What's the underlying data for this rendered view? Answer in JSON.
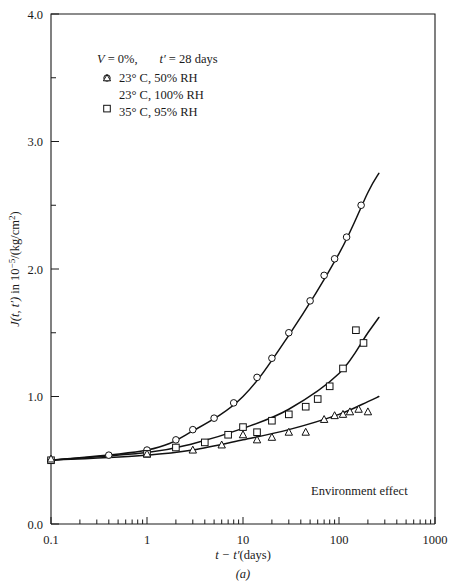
{
  "figure": {
    "caption": "(a)",
    "annotation": "Environment effect"
  },
  "legend": {
    "header_v": "V",
    "header_v_val": "= 0%,",
    "header_t": "t′",
    "header_t_val": "= 28 days",
    "entries": [
      {
        "marker": "circle",
        "label": "23° C,  50% RH"
      },
      {
        "marker": "triangle",
        "label": "23° C,  100% RH"
      },
      {
        "marker": "square",
        "label": "35° C,  95% RH"
      }
    ]
  },
  "axes": {
    "x_label_main": "t − t′",
    "x_label_unit": "(days)",
    "y_label_fn": "J(t, t′)",
    "y_label_rest": " in 10",
    "y_label_exp": "−5",
    "y_label_tail": "/(kg/cm",
    "y_label_exp2": "2",
    "y_label_close": ")",
    "x_ticks": [
      "0.1",
      "1",
      "10",
      "100",
      "1000"
    ],
    "y_ticks": [
      "0.0",
      "1.0",
      "2.0",
      "3.0",
      "4.0"
    ]
  },
  "chart_data": {
    "type": "scatter",
    "title": "",
    "subtitle": "Environment effect",
    "xlabel": "t − t′ (days)",
    "ylabel": "J(t, t′) in 10−5/(kg/cm²)",
    "xscale": "log",
    "yscale": "linear",
    "xlim": [
      0.1,
      1000
    ],
    "ylim": [
      0.0,
      4.0
    ],
    "x_tick_values": [
      0.1,
      1,
      10,
      100,
      1000
    ],
    "y_tick_values": [
      0.0,
      1.0,
      2.0,
      3.0,
      4.0
    ],
    "y_minor_tick_values": [
      0.5,
      1.5,
      2.5,
      3.5
    ],
    "grid": false,
    "legend_position": "upper-left",
    "legend_note": "V = 0%,  t′ = 28 days",
    "series": [
      {
        "name": "23° C, 50% RH",
        "marker": "circle",
        "points": [
          {
            "x": 0.1,
            "y": 0.5
          },
          {
            "x": 0.4,
            "y": 0.54
          },
          {
            "x": 1.0,
            "y": 0.58
          },
          {
            "x": 2.0,
            "y": 0.66
          },
          {
            "x": 3.0,
            "y": 0.74
          },
          {
            "x": 5.0,
            "y": 0.83
          },
          {
            "x": 8.0,
            "y": 0.95
          },
          {
            "x": 14.0,
            "y": 1.15
          },
          {
            "x": 20.0,
            "y": 1.3
          },
          {
            "x": 30.0,
            "y": 1.5
          },
          {
            "x": 50.0,
            "y": 1.75
          },
          {
            "x": 70.0,
            "y": 1.95
          },
          {
            "x": 90.0,
            "y": 2.08
          },
          {
            "x": 120.0,
            "y": 2.25
          },
          {
            "x": 170.0,
            "y": 2.5
          }
        ],
        "fit_curve": [
          {
            "x": 0.1,
            "y": 0.5
          },
          {
            "x": 1.0,
            "y": 0.58
          },
          {
            "x": 3.0,
            "y": 0.73
          },
          {
            "x": 10.0,
            "y": 1.0
          },
          {
            "x": 30.0,
            "y": 1.48
          },
          {
            "x": 100.0,
            "y": 2.12
          },
          {
            "x": 200.0,
            "y": 2.6
          },
          {
            "x": 260.0,
            "y": 2.75
          }
        ]
      },
      {
        "name": "35° C, 95% RH",
        "marker": "square",
        "points": [
          {
            "x": 0.1,
            "y": 0.5
          },
          {
            "x": 1.0,
            "y": 0.55
          },
          {
            "x": 2.0,
            "y": 0.6
          },
          {
            "x": 4.0,
            "y": 0.64
          },
          {
            "x": 7.0,
            "y": 0.7
          },
          {
            "x": 10.0,
            "y": 0.76
          },
          {
            "x": 14.0,
            "y": 0.72
          },
          {
            "x": 20.0,
            "y": 0.81
          },
          {
            "x": 30.0,
            "y": 0.86
          },
          {
            "x": 45.0,
            "y": 0.92
          },
          {
            "x": 60.0,
            "y": 0.98
          },
          {
            "x": 80.0,
            "y": 1.08
          },
          {
            "x": 110.0,
            "y": 1.22
          },
          {
            "x": 150.0,
            "y": 1.52
          },
          {
            "x": 180.0,
            "y": 1.42
          }
        ],
        "fit_curve": [
          {
            "x": 0.1,
            "y": 0.5
          },
          {
            "x": 1.0,
            "y": 0.56
          },
          {
            "x": 3.0,
            "y": 0.63
          },
          {
            "x": 10.0,
            "y": 0.75
          },
          {
            "x": 30.0,
            "y": 0.9
          },
          {
            "x": 100.0,
            "y": 1.18
          },
          {
            "x": 200.0,
            "y": 1.5
          },
          {
            "x": 260.0,
            "y": 1.62
          }
        ]
      },
      {
        "name": "23° C, 100% RH",
        "marker": "triangle",
        "points": [
          {
            "x": 0.1,
            "y": 0.51
          },
          {
            "x": 1.0,
            "y": 0.55
          },
          {
            "x": 3.0,
            "y": 0.58
          },
          {
            "x": 6.0,
            "y": 0.62
          },
          {
            "x": 10.0,
            "y": 0.7
          },
          {
            "x": 14.0,
            "y": 0.66
          },
          {
            "x": 20.0,
            "y": 0.68
          },
          {
            "x": 30.0,
            "y": 0.72
          },
          {
            "x": 45.0,
            "y": 0.72
          },
          {
            "x": 70.0,
            "y": 0.82
          },
          {
            "x": 90.0,
            "y": 0.85
          },
          {
            "x": 110.0,
            "y": 0.86
          },
          {
            "x": 130.0,
            "y": 0.88
          },
          {
            "x": 160.0,
            "y": 0.9
          },
          {
            "x": 200.0,
            "y": 0.88
          }
        ],
        "fit_curve": [
          {
            "x": 0.1,
            "y": 0.5
          },
          {
            "x": 1.0,
            "y": 0.54
          },
          {
            "x": 3.0,
            "y": 0.58
          },
          {
            "x": 10.0,
            "y": 0.66
          },
          {
            "x": 30.0,
            "y": 0.74
          },
          {
            "x": 100.0,
            "y": 0.86
          },
          {
            "x": 200.0,
            "y": 0.96
          },
          {
            "x": 260.0,
            "y": 1.0
          }
        ]
      }
    ]
  }
}
